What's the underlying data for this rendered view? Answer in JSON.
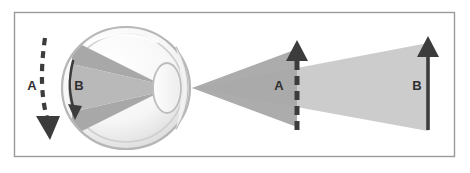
{
  "figure": {
    "frame": {
      "border_color": "#9a9a9a",
      "background_color": "#ffffff",
      "x": 14,
      "y": 12,
      "width": 441,
      "height": 145
    },
    "colors": {
      "ray_cone_near": "#a8a8a8",
      "ray_cone_far": "#c9c9c9",
      "arrow_dark": "#3c3c3c",
      "eye_outline": "#b0b0b0",
      "eye_fill": "#f2f2f2",
      "label_text": "#2f2f2f"
    },
    "labels": [
      {
        "id": "label-a-left",
        "text": "A",
        "x": 32,
        "y": 90
      },
      {
        "id": "label-b-left",
        "text": "B",
        "x": 79,
        "y": 90
      },
      {
        "id": "label-a-right",
        "text": "A",
        "x": 279,
        "y": 90
      },
      {
        "id": "label-b-right",
        "text": "B",
        "x": 417,
        "y": 90
      }
    ],
    "elements": {
      "eye": {
        "name": "eye-globe",
        "center_x": 126,
        "center_y": 88,
        "radius_x": 64,
        "radius_y": 61
      },
      "lens": {
        "name": "eye-lens",
        "center_x": 167,
        "center_y": 88,
        "radius_x": 14,
        "radius_y": 25
      },
      "retina_image_arrow": {
        "name": "retina-image-arrow-b",
        "style": "curved-solid",
        "direction": "down"
      },
      "object_arrow_a_left": {
        "name": "object-arrow-a-dashed-left",
        "style": "curved-dashed",
        "direction": "down"
      },
      "object_arrow_a_right": {
        "name": "object-arrow-a-dashed",
        "style": "dashed",
        "direction": "up",
        "x": 297,
        "top_y": 46,
        "bottom_y": 130
      },
      "object_arrow_b_right": {
        "name": "object-arrow-b-solid",
        "style": "solid",
        "direction": "up",
        "x": 428,
        "top_y": 40,
        "bottom_y": 130
      }
    }
  }
}
